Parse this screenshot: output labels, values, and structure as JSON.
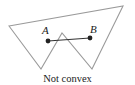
{
  "figure": {
    "caption": "Not convex",
    "polygon": {
      "points": "9,26 123,6 92,69 62,33 41,69",
      "stroke": "#9a9a9a"
    },
    "segment": {
      "stroke": "#333333",
      "start": {
        "label": "A",
        "x": 48,
        "y": 41
      },
      "end": {
        "label": "B",
        "x": 90,
        "y": 38
      }
    }
  }
}
